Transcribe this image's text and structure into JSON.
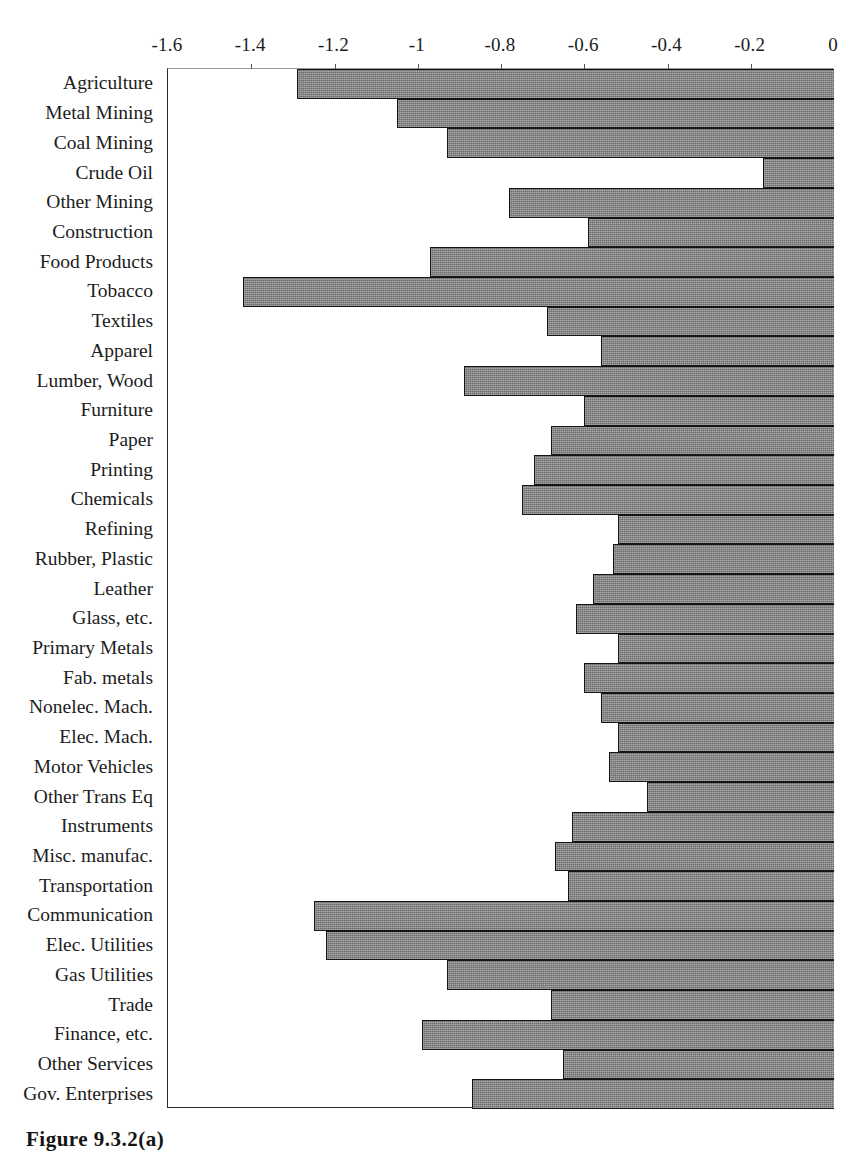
{
  "caption": "Figure 9.3.2(a)",
  "chart_data": {
    "type": "bar",
    "orientation": "horizontal",
    "title": "",
    "subtitle": "",
    "xlabel": "",
    "ylabel": "",
    "xlim": [
      -1.6,
      0
    ],
    "ylim": [],
    "grid": false,
    "legend": [],
    "legend_position": "none",
    "axis_position": "top",
    "bar_color": "#7b7b7b",
    "bar_edge_color": "#151515",
    "background_color": "#ffffff",
    "xticks": [
      -1.6,
      -1.4,
      -1.2,
      -1,
      -0.8,
      -0.6,
      -0.4,
      -0.2,
      0
    ],
    "xtick_labels": [
      "-1.6",
      "-1.4",
      "-1.2",
      "-1",
      "-0.8",
      "-0.6",
      "-0.4",
      "-0.2",
      "0"
    ],
    "categories": [
      "Agriculture",
      "Metal Mining",
      "Coal Mining",
      "Crude Oil",
      "Other Mining",
      "Construction",
      "Food Products",
      "Tobacco",
      "Textiles",
      "Apparel",
      "Lumber, Wood",
      "Furniture",
      "Paper",
      "Printing",
      "Chemicals",
      "Refining",
      "Rubber, Plastic",
      "Leather",
      "Glass, etc.",
      "Primary Metals",
      "Fab. metals",
      "Nonelec. Mach.",
      "Elec. Mach.",
      "Motor Vehicles",
      "Other Trans Eq",
      "Instruments",
      "Misc. manufac.",
      "Transportation",
      "Communication",
      "Elec. Utilities",
      "Gas Utilities",
      "Trade",
      "Finance, etc.",
      "Other Services",
      "Gov. Enterprises"
    ],
    "values": [
      -1.29,
      -1.05,
      -0.93,
      -0.17,
      -0.78,
      -0.59,
      -0.97,
      -1.42,
      -0.69,
      -0.56,
      -0.89,
      -0.6,
      -0.68,
      -0.72,
      -0.75,
      -0.52,
      -0.53,
      -0.58,
      -0.62,
      -0.52,
      -0.6,
      -0.56,
      -0.52,
      -0.54,
      -0.45,
      -0.63,
      -0.67,
      -0.64,
      -1.25,
      -1.22,
      -0.93,
      -0.68,
      -0.99,
      -0.65,
      -0.87
    ]
  }
}
